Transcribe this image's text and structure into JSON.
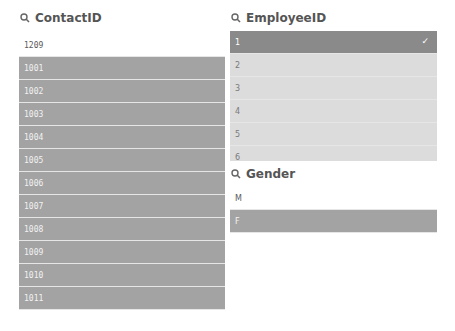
{
  "contact_panel": {
    "title": "ContactID",
    "rows": [
      {
        "value": "1209",
        "state": "possible"
      },
      {
        "value": "1001",
        "state": "excluded"
      },
      {
        "value": "1002",
        "state": "excluded"
      },
      {
        "value": "1003",
        "state": "excluded"
      },
      {
        "value": "1004",
        "state": "excluded"
      },
      {
        "value": "1005",
        "state": "excluded"
      },
      {
        "value": "1006",
        "state": "excluded"
      },
      {
        "value": "1007",
        "state": "excluded"
      },
      {
        "value": "1008",
        "state": "excluded"
      },
      {
        "value": "1009",
        "state": "excluded"
      },
      {
        "value": "1010",
        "state": "excluded"
      },
      {
        "value": "1011",
        "state": "excluded"
      }
    ]
  },
  "employee_panel": {
    "title": "EmployeeID",
    "rows": [
      {
        "value": "1",
        "state": "selected",
        "check": "✓"
      },
      {
        "value": "2",
        "state": "alternative"
      },
      {
        "value": "3",
        "state": "alternative"
      },
      {
        "value": "4",
        "state": "alternative"
      },
      {
        "value": "5",
        "state": "alternative"
      },
      {
        "value": "6",
        "state": "alternative"
      }
    ]
  },
  "gender_panel": {
    "title": "Gender",
    "rows": [
      {
        "value": "M",
        "state": "possible"
      },
      {
        "value": "F",
        "state": "excluded"
      }
    ]
  },
  "icons": {
    "search": "search-icon",
    "check": "check-icon"
  }
}
